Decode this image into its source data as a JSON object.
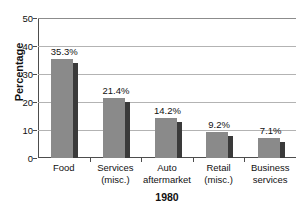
{
  "chart_data": {
    "type": "bar",
    "title": "",
    "xlabel": "1980",
    "ylabel": "Percentage",
    "categories": [
      "Food",
      "Services (misc.)",
      "Auto aftermarket",
      "Retail (misc.)",
      "Business services"
    ],
    "category_lines": [
      [
        "Food",
        ""
      ],
      [
        "Services",
        "(misc.)"
      ],
      [
        "Auto",
        "aftermarket"
      ],
      [
        "Retail",
        "(misc.)"
      ],
      [
        "Business",
        "services"
      ]
    ],
    "values": [
      35.3,
      21.4,
      14.2,
      9.2,
      7.1
    ],
    "data_labels": [
      "35.3%",
      "21.4%",
      "14.2%",
      "9.2%",
      "7.1%"
    ],
    "ylim": [
      0,
      50
    ],
    "ytick_labels": [
      "0",
      "10",
      "20",
      "30",
      "40",
      "50"
    ],
    "ytick_values": [
      0,
      10,
      20,
      30,
      40,
      50
    ],
    "grid": true,
    "legend": "none",
    "colors": {
      "bar_face": "#8a8a8a",
      "bar_shadow": "#3a3a3a",
      "gridline": "#b3b3b3",
      "axis": "#4d4d4d",
      "text": "#111111",
      "background": "#ffffff"
    }
  }
}
